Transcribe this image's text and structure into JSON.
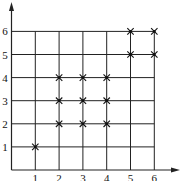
{
  "chart_data": {
    "type": "scatter",
    "title": "",
    "xlabel": "",
    "ylabel": "",
    "x_ticks": [
      "1",
      "2",
      "3",
      "4",
      "5",
      "6"
    ],
    "y_ticks": [
      "1",
      "2",
      "3",
      "4",
      "5",
      "6"
    ],
    "xlim": [
      0,
      6
    ],
    "ylim": [
      0,
      6
    ],
    "grid": true,
    "marker": "x",
    "points": [
      {
        "x": 1,
        "y": 1
      },
      {
        "x": 2,
        "y": 2
      },
      {
        "x": 3,
        "y": 2
      },
      {
        "x": 4,
        "y": 2
      },
      {
        "x": 2,
        "y": 3
      },
      {
        "x": 3,
        "y": 3
      },
      {
        "x": 4,
        "y": 3
      },
      {
        "x": 2,
        "y": 4
      },
      {
        "x": 3,
        "y": 4
      },
      {
        "x": 4,
        "y": 4
      },
      {
        "x": 5,
        "y": 5
      },
      {
        "x": 6,
        "y": 5
      },
      {
        "x": 5,
        "y": 6
      },
      {
        "x": 6,
        "y": 6
      }
    ],
    "colors": {
      "line": "#222222",
      "marker": "#111111",
      "background": "#ffffff"
    }
  }
}
